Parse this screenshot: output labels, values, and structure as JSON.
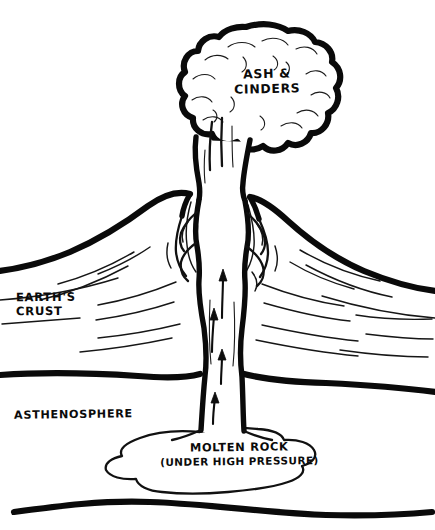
{
  "diagram": {
    "palette": {
      "ink": "#0a0a0a",
      "background": "#ffffff"
    },
    "labels": {
      "ash_cinders_line1": "Ash &",
      "ash_cinders_line2": "Cinders",
      "earths_crust_line1": "Earth's",
      "earths_crust_line2": "Crust",
      "asthenosphere": "Asthenosphere",
      "molten_rock_line1": "Molten Rock",
      "molten_rock_line2": "(Under High Pressure)"
    },
    "features": {
      "ash_cloud": "eruption-ash-cloud",
      "eruption_column": "eruption-column",
      "volcano_cone": "volcano-cone",
      "vent": "volcano-vent",
      "conduit": "magma-conduit",
      "magma_chamber": "magma-chamber",
      "crust_boundary_top": "crust-surface-boundary",
      "crust_boundary_bottom": "crust-asthenosphere-boundary",
      "lower_boundary": "lower-mantle-boundary",
      "strata": "rock-strata-layers",
      "flow_arrows": "magma-flow-arrows"
    },
    "flow_arrow_count": 4
  }
}
